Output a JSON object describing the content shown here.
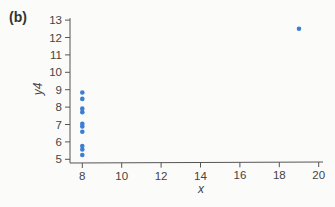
{
  "panel": {
    "label": "(b)"
  },
  "chart_data": {
    "type": "scatter",
    "title": "",
    "xlabel": "x",
    "ylabel": "y4",
    "xlim": [
      7.5,
      20.2
    ],
    "ylim": [
      4.8,
      13.2
    ],
    "x_ticks": [
      8,
      10,
      12,
      14,
      16,
      18,
      20
    ],
    "y_ticks": [
      5,
      6,
      7,
      8,
      9,
      10,
      11,
      12,
      13
    ],
    "grid": false,
    "legend": null,
    "marker_color": "#3b7fd4",
    "series": [
      {
        "name": "y4",
        "x": [
          8,
          8,
          8,
          8,
          8,
          8,
          8,
          8,
          8,
          8,
          19
        ],
        "y": [
          6.58,
          5.76,
          7.71,
          8.84,
          8.47,
          7.04,
          5.25,
          5.56,
          7.91,
          6.89,
          12.5
        ]
      }
    ]
  }
}
